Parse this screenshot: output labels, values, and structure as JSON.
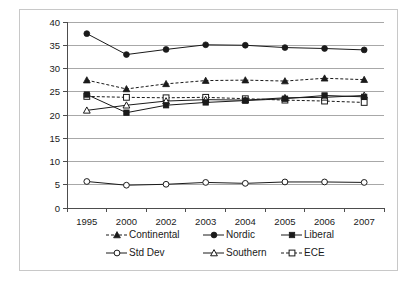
{
  "chart_data": {
    "type": "line",
    "title": "",
    "xlabel": "",
    "ylabel": "",
    "categories": [
      "1995",
      "2000",
      "2002",
      "2003",
      "2004",
      "2005",
      "2006",
      "2007"
    ],
    "ylim": [
      0,
      40
    ],
    "ytick_step": 5,
    "yticks": [
      "40",
      "35",
      "30",
      "25",
      "20",
      "15",
      "10",
      "5",
      "0"
    ],
    "grid": "horizontal",
    "legend_position": "bottom",
    "series": [
      {
        "name": "Continental",
        "marker": "filled-triangle",
        "line": "dashed",
        "values": [
          27.5,
          25.6,
          26.7,
          27.4,
          27.5,
          27.3,
          27.9,
          27.6
        ]
      },
      {
        "name": "Nordic",
        "marker": "filled-circle",
        "line": "solid",
        "values": [
          37.5,
          33.0,
          34.1,
          35.1,
          35.0,
          34.5,
          34.3,
          34.0
        ]
      },
      {
        "name": "Liberal",
        "marker": "filled-square",
        "line": "solid",
        "values": [
          24.4,
          20.5,
          22.1,
          22.7,
          23.1,
          23.5,
          24.2,
          23.9
        ]
      },
      {
        "name": "Std Dev",
        "marker": "open-circle",
        "line": "solid",
        "values": [
          5.7,
          4.9,
          5.1,
          5.5,
          5.3,
          5.6,
          5.6,
          5.5
        ]
      },
      {
        "name": "Southern",
        "marker": "open-triangle",
        "line": "solid",
        "values": [
          21.0,
          22.1,
          23.0,
          23.3,
          23.2,
          23.7,
          23.8,
          24.2
        ]
      },
      {
        "name": "ECE",
        "marker": "open-square",
        "line": "dashed",
        "values": [
          24.0,
          23.8,
          23.7,
          23.8,
          23.5,
          23.2,
          23.0,
          22.7
        ]
      }
    ]
  },
  "legend": {
    "items": [
      {
        "label": "Continental"
      },
      {
        "label": "Nordic"
      },
      {
        "label": "Liberal"
      },
      {
        "label": "Std Dev"
      },
      {
        "label": "Southern"
      },
      {
        "label": "ECE"
      }
    ]
  },
  "colors": {
    "ink": "#1a1a1a",
    "axis": "#4d4d4d",
    "grid": "#a8a8a8",
    "frame": "#c8c8c8",
    "plot_background": "#ffffff"
  }
}
